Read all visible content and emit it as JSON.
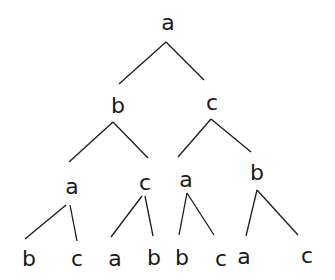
{
  "diagram": {
    "type": "tree",
    "nodes": [
      {
        "id": "n0",
        "label": "a",
        "x": 168,
        "y": 22
      },
      {
        "id": "n1",
        "label": "b",
        "x": 118,
        "y": 105
      },
      {
        "id": "n2",
        "label": "c",
        "x": 212,
        "y": 102
      },
      {
        "id": "n3",
        "label": "a",
        "x": 72,
        "y": 186
      },
      {
        "id": "n4",
        "label": "c",
        "x": 145,
        "y": 182
      },
      {
        "id": "n5",
        "label": "a",
        "x": 186,
        "y": 179
      },
      {
        "id": "n6",
        "label": "b",
        "x": 257,
        "y": 172
      },
      {
        "id": "n7",
        "label": "b",
        "x": 29,
        "y": 258
      },
      {
        "id": "n8",
        "label": "c",
        "x": 77,
        "y": 258
      },
      {
        "id": "n9",
        "label": "a",
        "x": 115,
        "y": 258
      },
      {
        "id": "n10",
        "label": "b",
        "x": 154,
        "y": 257
      },
      {
        "id": "n11",
        "label": "b",
        "x": 182,
        "y": 257
      },
      {
        "id": "n12",
        "label": "c",
        "x": 221,
        "y": 258
      },
      {
        "id": "n13",
        "label": "a",
        "x": 244,
        "y": 256
      },
      {
        "id": "n14",
        "label": "c",
        "x": 307,
        "y": 255
      }
    ],
    "edges": [
      {
        "from": "n0",
        "to": "n1",
        "x1": 166,
        "y1": 42,
        "x2": 119,
        "y2": 84
      },
      {
        "from": "n0",
        "to": "n2",
        "x1": 166,
        "y1": 42,
        "x2": 204,
        "y2": 80
      },
      {
        "from": "n1",
        "to": "n3",
        "x1": 113,
        "y1": 122,
        "x2": 69,
        "y2": 162
      },
      {
        "from": "n1",
        "to": "n4",
        "x1": 113,
        "y1": 122,
        "x2": 148,
        "y2": 158
      },
      {
        "from": "n2",
        "to": "n5",
        "x1": 211,
        "y1": 119,
        "x2": 178,
        "y2": 157
      },
      {
        "from": "n2",
        "to": "n6",
        "x1": 211,
        "y1": 119,
        "x2": 251,
        "y2": 152
      },
      {
        "from": "n3",
        "to": "n7",
        "x1": 66,
        "y1": 205,
        "x2": 25,
        "y2": 239
      },
      {
        "from": "n3",
        "to": "n8",
        "x1": 70,
        "y1": 205,
        "x2": 77,
        "y2": 241
      },
      {
        "from": "n4",
        "to": "n9",
        "x1": 142,
        "y1": 196,
        "x2": 111,
        "y2": 237
      },
      {
        "from": "n4",
        "to": "n10",
        "x1": 145,
        "y1": 196,
        "x2": 153,
        "y2": 236
      },
      {
        "from": "n5",
        "to": "n11",
        "x1": 187,
        "y1": 193,
        "x2": 179,
        "y2": 235
      },
      {
        "from": "n5",
        "to": "n12",
        "x1": 187,
        "y1": 193,
        "x2": 214,
        "y2": 235
      },
      {
        "from": "n6",
        "to": "n13",
        "x1": 257,
        "y1": 190,
        "x2": 246,
        "y2": 236
      },
      {
        "from": "n6",
        "to": "n14",
        "x1": 257,
        "y1": 190,
        "x2": 298,
        "y2": 235
      }
    ]
  }
}
